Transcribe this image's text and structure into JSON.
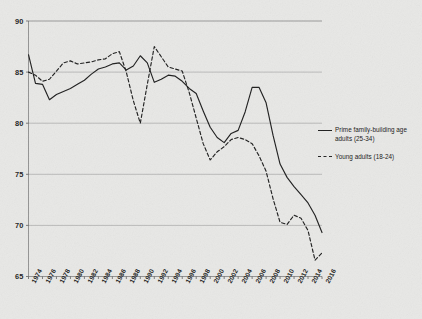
{
  "chart_data": {
    "type": "line",
    "title": "",
    "subtitle": "",
    "xlabel": "",
    "ylabel": "",
    "xlim": [
      1974,
      2016
    ],
    "ylim": [
      65,
      90
    ],
    "yticks": [
      65,
      70,
      75,
      80,
      85,
      90
    ],
    "ytick_labels": [
      "65",
      "70",
      "75",
      "80",
      "85",
      "90"
    ],
    "grid": true,
    "grid_axis": "y",
    "legend_position": "right",
    "x": [
      1974,
      1975,
      1976,
      1977,
      1978,
      1979,
      1980,
      1981,
      1982,
      1983,
      1984,
      1985,
      1986,
      1987,
      1988,
      1989,
      1990,
      1991,
      1992,
      1993,
      1994,
      1995,
      1996,
      1997,
      1998,
      1999,
      2000,
      2001,
      2002,
      2003,
      2004,
      2005,
      2006,
      2007,
      2008,
      2009,
      2010,
      2011,
      2012,
      2013,
      2014,
      2015,
      2016
    ],
    "xticks": [
      1974,
      1976,
      1978,
      1980,
      1982,
      1984,
      1986,
      1988,
      1990,
      1992,
      1994,
      1996,
      1998,
      2000,
      2002,
      2004,
      2006,
      2008,
      2010,
      2012,
      2014,
      2016
    ],
    "xtick_labels": [
      "1974",
      "1976",
      "1978",
      "1980",
      "1982",
      "1984",
      "1986",
      "1988",
      "1990",
      "1992",
      "1994",
      "1996",
      "1998",
      "2000",
      "2002",
      "2004",
      "2006",
      "2008",
      "2010",
      "2012",
      "2014",
      "2016"
    ],
    "series": [
      {
        "name": "Prime family-building age adults (25-34)",
        "style": "solid",
        "color": "#1d1d1d",
        "values": [
          86.7,
          83.9,
          83.8,
          82.3,
          82.8,
          83.1,
          83.4,
          83.8,
          84.2,
          84.8,
          85.3,
          85.5,
          85.8,
          85.9,
          85.2,
          85.6,
          86.6,
          85.9,
          84.0,
          84.3,
          84.7,
          84.6,
          84.1,
          83.4,
          82.9,
          81.2,
          79.6,
          78.6,
          78.1,
          79.0,
          79.3,
          81.1,
          83.5,
          83.5,
          82.0,
          78.8,
          76.0,
          74.7,
          73.8,
          73.0,
          72.2,
          71.0,
          69.3
        ]
      },
      {
        "name": "Young adults (18-24)",
        "style": "dashed",
        "color": "#1d1d1d",
        "values": [
          85.0,
          84.7,
          84.1,
          84.3,
          85.1,
          85.9,
          86.1,
          85.8,
          85.9,
          86.0,
          86.2,
          86.3,
          86.8,
          87.0,
          85.0,
          82.2,
          80.0,
          83.8,
          87.5,
          86.5,
          85.5,
          85.3,
          85.1,
          83.0,
          80.5,
          78.0,
          76.4,
          77.2,
          77.7,
          78.4,
          78.6,
          78.4,
          78.0,
          76.8,
          75.3,
          72.6,
          70.3,
          70.1,
          71.0,
          70.7,
          69.5,
          66.6,
          67.3
        ]
      }
    ]
  },
  "legend": {
    "entries": [
      {
        "label": "Prime family-building age adults (25-34)",
        "style": "solid"
      },
      {
        "label": "Young adults (18-24)",
        "style": "dashed"
      }
    ]
  }
}
